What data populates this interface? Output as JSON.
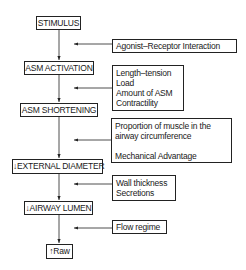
{
  "flow": {
    "steps": [
      {
        "label": "STIMULUS"
      },
      {
        "label": "ASM ACTIVATION"
      },
      {
        "label": "ASM SHORTENING"
      },
      {
        "label": "↓EXTERNAL DIAMETER"
      },
      {
        "label": "↓AIRWAY LUMEN"
      },
      {
        "label": "↑Raw"
      }
    ]
  },
  "modifiers": [
    {
      "lines": [
        "Agonist–Receptor Interaction"
      ]
    },
    {
      "lines": [
        "Length–tension",
        "Load",
        "Amount of ASM",
        "Contractility"
      ]
    },
    {
      "lines": [
        "Proportion of muscle in the",
        "airway circumference",
        "",
        "Mechanical Advantage"
      ]
    },
    {
      "lines": [
        "Wall thickness",
        "Secretions"
      ]
    },
    {
      "lines": [
        "Flow regime"
      ]
    }
  ],
  "colors": {
    "line": "#222222",
    "background": "#ffffff"
  }
}
